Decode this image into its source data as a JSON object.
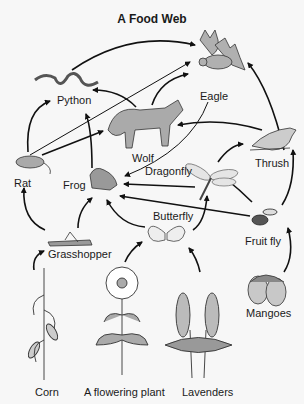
{
  "title": "A Food Web",
  "organisms": {
    "eagle": "Eagle",
    "python": "Python",
    "wolf": "Wolf",
    "rat": "Rat",
    "frog": "Frog",
    "dragonfly": "Dragonfly",
    "thrush": "Thrush",
    "butterfly": "Butterfly",
    "fruit_fly": "Fruit fly",
    "grasshopper": "Grasshopper",
    "mangoes": "Mangoes",
    "corn": "Corn",
    "flowering_plant": "A flowering plant",
    "lavenders": "Lavenders"
  },
  "edges": [
    {
      "from": "Python",
      "to": "Eagle"
    },
    {
      "from": "Rat",
      "to": "Eagle"
    },
    {
      "from": "Wolf",
      "to": "Eagle"
    },
    {
      "from": "Thrush",
      "to": "Eagle"
    },
    {
      "from": "Rat",
      "to": "Python"
    },
    {
      "from": "Frog",
      "to": "Python"
    },
    {
      "from": "Wolf",
      "to": "Python"
    },
    {
      "from": "Rat",
      "to": "Wolf"
    },
    {
      "from": "Thrush",
      "to": "Wolf"
    },
    {
      "from": "Eagle",
      "to": "Frog"
    },
    {
      "from": "Dragonfly",
      "to": "Frog"
    },
    {
      "from": "Fruit fly",
      "to": "Frog"
    },
    {
      "from": "Butterfly",
      "to": "Frog"
    },
    {
      "from": "Grasshopper",
      "to": "Frog"
    },
    {
      "from": "Grasshopper",
      "to": "Rat"
    },
    {
      "from": "Corn",
      "to": "Grasshopper"
    },
    {
      "from": "A flowering plant",
      "to": "Butterfly"
    },
    {
      "from": "Lavenders",
      "to": "Butterfly"
    },
    {
      "from": "Butterfly",
      "to": "Dragonfly"
    },
    {
      "from": "Fruit fly",
      "to": "Dragonfly"
    },
    {
      "from": "Dragonfly",
      "to": "Thrush"
    },
    {
      "from": "Fruit fly",
      "to": "Thrush"
    },
    {
      "from": "Mangoes",
      "to": "Fruit fly"
    }
  ]
}
